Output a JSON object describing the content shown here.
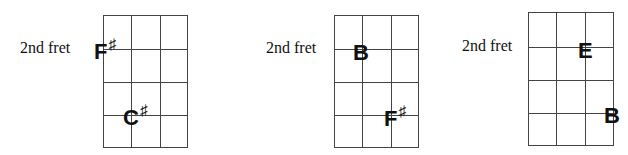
{
  "diagrams": [
    {
      "label": "2nd fret",
      "grid": {
        "strings": 4,
        "frets": 4
      },
      "notes": [
        {
          "name": "F",
          "accidental": "♯",
          "string": 1,
          "fret": 1
        },
        {
          "name": "C",
          "accidental": "♯",
          "string": 2,
          "fret": 3
        }
      ]
    },
    {
      "label": "2nd fret",
      "grid": {
        "strings": 4,
        "frets": 4
      },
      "notes": [
        {
          "name": "B",
          "accidental": "",
          "string": 1,
          "fret": 1
        },
        {
          "name": "F",
          "accidental": "♯",
          "string": 3,
          "fret": 3
        }
      ]
    },
    {
      "label": "2nd fret",
      "grid": {
        "strings": 4,
        "frets": 4
      },
      "notes": [
        {
          "name": "E",
          "accidental": "",
          "string": 3,
          "fret": 1
        },
        {
          "name": "B",
          "accidental": "",
          "string": 4,
          "fret": 3
        }
      ]
    }
  ]
}
